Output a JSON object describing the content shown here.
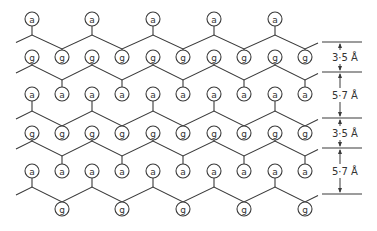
{
  "diagram": {
    "node_labels": {
      "a": "a",
      "g": "g"
    },
    "columns_x": [
      32,
      62,
      92,
      122,
      153,
      183,
      214,
      244,
      275,
      305
    ],
    "chains": [
      {
        "id": 1,
        "peak_y": 35,
        "trough_y": 49,
        "start": "peak",
        "up_group": "a",
        "up_y": 19,
        "down_group": "g",
        "down_y": 57,
        "up_cols": [
          0,
          2,
          4,
          6,
          8
        ],
        "down_cols": [
          1,
          3,
          5,
          7,
          9
        ]
      },
      {
        "id": 2,
        "peak_y": 65,
        "trough_y": 80,
        "start": "peak",
        "up_group": "g",
        "up_y": 57,
        "down_group": "a",
        "down_y": 94,
        "up_cols": [
          0,
          2,
          4,
          6,
          8
        ],
        "down_cols": [
          1,
          3,
          5,
          7,
          9
        ]
      },
      {
        "id": 3,
        "peak_y": 111,
        "trough_y": 126,
        "start": "peak",
        "up_group": "a",
        "up_y": 94,
        "down_group": "g",
        "down_y": 133,
        "up_cols": [
          0,
          2,
          4,
          6,
          8
        ],
        "down_cols": [
          1,
          3,
          5,
          7,
          9
        ]
      },
      {
        "id": 4,
        "peak_y": 141,
        "trough_y": 156,
        "start": "peak",
        "up_group": "g",
        "up_y": 133,
        "down_group": "a",
        "down_y": 171,
        "up_cols": [
          0,
          2,
          4,
          6,
          8
        ],
        "down_cols": [
          1,
          3,
          5,
          7,
          9
        ]
      },
      {
        "id": 5,
        "peak_y": 187,
        "trough_y": 202,
        "start": "peak",
        "up_group": "a",
        "up_y": 171,
        "down_group": "g",
        "down_y": 209,
        "up_cols": [
          0,
          2,
          4,
          6,
          8
        ],
        "down_cols": [
          1,
          3,
          5,
          7,
          9
        ]
      }
    ],
    "scale_bar": {
      "lines_y": [
        42,
        72,
        118,
        148,
        194
      ],
      "spacings": [
        {
          "label": "3·5 Å",
          "value": 3.5,
          "unit": "Å",
          "from_y": 42,
          "to_y": 72
        },
        {
          "label": "5·7 Å",
          "value": 5.7,
          "unit": "Å",
          "from_y": 72,
          "to_y": 118
        },
        {
          "label": "3·5 Å",
          "value": 3.5,
          "unit": "Å",
          "from_y": 118,
          "to_y": 148
        },
        {
          "label": "5·7 Å",
          "value": 5.7,
          "unit": "Å",
          "from_y": 148,
          "to_y": 194
        }
      ]
    },
    "colors": {
      "stroke": "#3a3a3a",
      "text": "#333333",
      "background": "#ffffff"
    }
  }
}
